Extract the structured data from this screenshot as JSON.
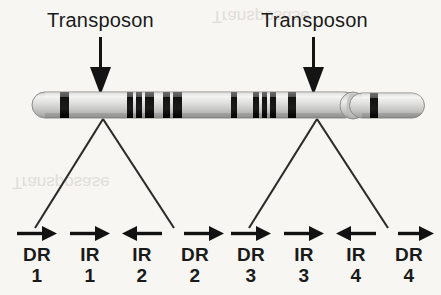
{
  "figure": {
    "type": "biology-diagram",
    "background_color": "#f7f6f3",
    "ink_color": "#1a1a1a"
  },
  "annotations": {
    "transposon_left": "Transposon",
    "transposon_right": "Transposon",
    "arrow_icon": "down-arrow-icon"
  },
  "chromosome": {
    "name": "chromosome-bar",
    "fill_light": "#e4e4e2",
    "fill_mid": "#c6c6c4",
    "band_color": "#1d1d1d",
    "bands": [
      63,
      130,
      137,
      144,
      160,
      167,
      233,
      255,
      262,
      269,
      285,
      372
    ],
    "centromere_x": 352
  },
  "repeat_groups": [
    {
      "name": "left-transposon-repeats",
      "elements": [
        {
          "arrow": "right",
          "main": "DR",
          "num": "1"
        },
        {
          "arrow": "right",
          "main": "IR",
          "num": "1"
        },
        {
          "arrow": "left",
          "main": "IR",
          "num": "2"
        },
        {
          "arrow": "right",
          "main": "DR",
          "num": "2"
        }
      ]
    },
    {
      "name": "right-transposon-repeats",
      "elements": [
        {
          "arrow": "right",
          "main": "DR",
          "num": "3"
        },
        {
          "arrow": "right",
          "main": "IR",
          "num": "3"
        },
        {
          "arrow": "left",
          "main": "IR",
          "num": "4"
        },
        {
          "arrow": "right",
          "main": "DR",
          "num": "4"
        }
      ]
    }
  ],
  "legend": {
    "DR": "Direct Repeat",
    "IR": "Inverted Repeat"
  },
  "bleed_through": {
    "note": "faint mirrored text showing through the page",
    "items": [
      "Transposase",
      "Transposase"
    ]
  }
}
